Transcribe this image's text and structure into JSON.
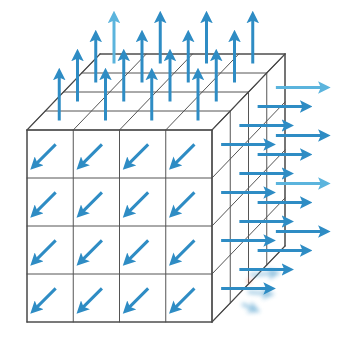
{
  "figure": {
    "name": "3d-grid-vector-field-diagram",
    "background_color": "#ffffff",
    "width": 340,
    "height": 342
  },
  "geometry": {
    "front_face": {
      "origin_x": 27,
      "origin_y": 130,
      "width": 185,
      "height": 192,
      "divisions_x": 4,
      "divisions_y": 4
    },
    "depth_offset_x": 73,
    "depth_offset_y": -76,
    "depth_divisions": 4
  },
  "style": {
    "edge_color": "#4a4a4a",
    "edge_width": 1.1,
    "grid_color": "#555555",
    "grid_width": 1.0,
    "arrow_color": "#2e8cc4",
    "arrow_color_light": "#5bb4dd",
    "arrow_width": 3.0,
    "cyan_line_color": "#3fd8e8",
    "red_line_color": "#f2737b",
    "dot_color": "#e0603a"
  },
  "faces": {
    "front": {
      "label": "front-face",
      "arrow_direction": "down-left",
      "arrow_dx": -22,
      "arrow_dy": 22,
      "rows": 4,
      "cols": 4,
      "count": 16
    },
    "top": {
      "label": "top-face",
      "arrow_direction": "up",
      "arrow_dx": 0,
      "arrow_dy": -48,
      "rows": 4,
      "cols": 4,
      "count": 16
    },
    "right": {
      "label": "right-face",
      "arrow_direction": "right",
      "arrow_dx": 50,
      "arrow_dy": 0,
      "rows": 4,
      "cols": 4,
      "count": 16
    }
  },
  "highlight_lines": [
    {
      "name": "cyan-highlight-line",
      "color": "#3fd8e8",
      "x1": 27,
      "y1": 274,
      "x2": 120,
      "y2": 274,
      "width": 3.2,
      "fade": "right"
    },
    {
      "name": "red-highlight-line",
      "color": "#f2737b",
      "x1": 120,
      "y1": 274,
      "x2": 212,
      "y2": 274,
      "width": 3.2,
      "fade": "left"
    }
  ],
  "faded_cluster": {
    "name": "blurred-arrow-cluster",
    "center_x": 252,
    "center_y": 284,
    "opacity": 0.55,
    "dot_x": 249,
    "dot_y": 281,
    "arrows": [
      {
        "x": 250,
        "y": 275,
        "dx": 26,
        "dy": -2
      },
      {
        "x": 248,
        "y": 292,
        "dx": 22,
        "dy": 2
      },
      {
        "x": 242,
        "y": 304,
        "dx": 14,
        "dy": 6
      }
    ]
  },
  "legend": {
    "arrow_field_label": "vector field arrows",
    "grid_label": "structured grid cells"
  }
}
